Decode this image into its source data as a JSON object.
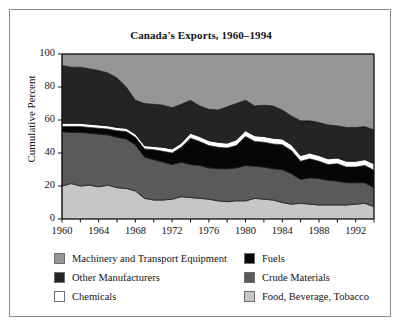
{
  "figure": {
    "background": "#ffffff",
    "border_color": "#8a8a8a"
  },
  "chart_data": {
    "type": "area",
    "title": "Canada's Exports, 1960–1994",
    "xlabel": "",
    "ylabel": "Cumulative Percent",
    "stacked": true,
    "normalized_to_100": true,
    "grid": false,
    "legend_position": "bottom",
    "xlim": [
      1960,
      1994
    ],
    "ylim": [
      0,
      100
    ],
    "ytick_labels": [
      "0",
      "20",
      "40",
      "60",
      "80",
      "100"
    ],
    "yticks": [
      0,
      20,
      40,
      60,
      80,
      100
    ],
    "xtick_labels": [
      "1960",
      "1964",
      "1968",
      "1972",
      "1976",
      "1980",
      "1984",
      "1988",
      "1992"
    ],
    "xticks": [
      1960,
      1964,
      1968,
      1972,
      1976,
      1980,
      1984,
      1988,
      1992
    ],
    "xminor_interval": 2,
    "x": [
      1960,
      1961,
      1962,
      1963,
      1964,
      1965,
      1966,
      1967,
      1968,
      1969,
      1970,
      1971,
      1972,
      1973,
      1974,
      1975,
      1976,
      1977,
      1978,
      1979,
      1980,
      1981,
      1982,
      1983,
      1984,
      1985,
      1986,
      1987,
      1988,
      1989,
      1990,
      1991,
      1992,
      1993,
      1994
    ],
    "series": [
      {
        "name": "Food, Beverage, Tobacco",
        "color": "#c6c6c6",
        "stack_order": 1,
        "values": [
          20.0,
          21.5,
          20.0,
          20.5,
          19.5,
          20.5,
          19.0,
          18.5,
          17.0,
          12.5,
          11.5,
          11.5,
          12.0,
          13.5,
          13.0,
          12.5,
          12.0,
          11.0,
          10.5,
          11.0,
          11.0,
          12.5,
          12.0,
          11.5,
          10.0,
          9.0,
          9.5,
          9.0,
          8.5,
          8.5,
          8.5,
          8.5,
          9.0,
          9.5,
          7.5
        ]
      },
      {
        "name": "Crude Materials",
        "color": "#5a5a5a",
        "stack_order": 2,
        "values": [
          33.0,
          31.0,
          32.5,
          31.5,
          32.0,
          30.5,
          30.5,
          30.0,
          28.0,
          25.0,
          24.5,
          23.0,
          21.0,
          21.0,
          20.0,
          20.0,
          19.0,
          19.5,
          20.0,
          20.0,
          21.5,
          19.5,
          19.5,
          19.0,
          20.0,
          18.5,
          14.5,
          16.0,
          16.0,
          15.0,
          14.5,
          13.5,
          13.0,
          12.5,
          11.5
        ]
      },
      {
        "name": "Fuels",
        "color": "#060606",
        "stack_order": 3,
        "values": [
          3.0,
          3.5,
          3.5,
          3.5,
          3.5,
          3.5,
          4.0,
          4.5,
          4.5,
          5.0,
          6.0,
          6.5,
          7.0,
          9.0,
          16.0,
          14.5,
          13.5,
          13.0,
          12.5,
          13.5,
          17.5,
          15.0,
          15.0,
          15.0,
          15.0,
          14.0,
          11.0,
          11.5,
          10.5,
          9.5,
          10.5,
          9.5,
          9.5,
          10.5,
          10.5
        ]
      },
      {
        "name": "Chemicals",
        "color": "#ffffff",
        "stack_order": 4,
        "values": [
          2.0,
          2.0,
          2.0,
          2.0,
          2.0,
          2.0,
          2.0,
          2.0,
          2.0,
          2.0,
          2.0,
          2.5,
          2.5,
          2.5,
          3.0,
          3.0,
          3.0,
          3.0,
          3.0,
          3.5,
          3.5,
          3.5,
          3.5,
          3.5,
          3.5,
          3.5,
          3.5,
          3.5,
          3.5,
          3.5,
          3.5,
          3.5,
          3.5,
          3.5,
          4.0
        ]
      },
      {
        "name": "Other Manufacturers",
        "color": "#242424",
        "stack_order": 5,
        "values": [
          35.0,
          34.0,
          34.0,
          33.5,
          33.0,
          32.0,
          30.0,
          25.0,
          20.5,
          25.5,
          25.5,
          25.5,
          25.0,
          23.5,
          20.0,
          18.5,
          19.0,
          19.5,
          22.0,
          22.0,
          18.5,
          18.0,
          19.0,
          19.5,
          17.5,
          17.5,
          21.0,
          19.5,
          20.0,
          20.5,
          19.5,
          20.5,
          20.5,
          20.0,
          20.5
        ]
      },
      {
        "name": "Machinery and Transport Equipment",
        "color": "#969696",
        "stack_order": 6,
        "values": [
          7.0,
          8.0,
          8.0,
          9.0,
          10.0,
          11.5,
          14.5,
          20.0,
          28.0,
          30.0,
          30.5,
          31.0,
          32.5,
          30.5,
          28.0,
          31.5,
          33.5,
          34.0,
          32.0,
          30.0,
          28.0,
          31.5,
          31.0,
          31.5,
          34.0,
          37.5,
          40.5,
          40.5,
          41.5,
          43.0,
          43.5,
          44.5,
          44.5,
          44.0,
          46.0
        ]
      }
    ],
    "boundaries_note": "Cumulative upper edges read off the plot; stack from bottom: Food/Beverage/Tobacco, Crude Materials, Fuels, Chemicals, Other Manufacturers, Machinery and Transport Equipment."
  },
  "legend": {
    "items": [
      {
        "label": "Machinery and Transport Equipment",
        "color": "#969696",
        "column": 0,
        "row": 0
      },
      {
        "label": "Other Manufacturers",
        "color": "#242424",
        "column": 0,
        "row": 1
      },
      {
        "label": "Chemicals",
        "color": "#ffffff",
        "column": 0,
        "row": 2
      },
      {
        "label": "Fuels",
        "color": "#060606",
        "column": 1,
        "row": 0
      },
      {
        "label": "Crude Materials",
        "color": "#5a5a5a",
        "column": 1,
        "row": 1
      },
      {
        "label": "Food, Beverage, Tobacco",
        "color": "#c6c6c6",
        "column": 1,
        "row": 2
      }
    ]
  }
}
